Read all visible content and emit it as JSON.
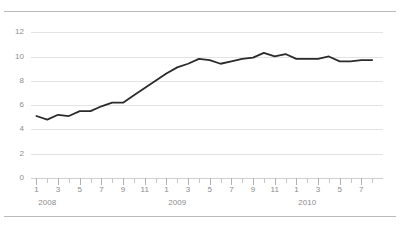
{
  "chart_data": {
    "type": "line",
    "title": "",
    "xlabel": "",
    "ylabel": "",
    "ylim": [
      0,
      13
    ],
    "yticks": [
      0,
      2,
      4,
      6,
      8,
      10,
      12
    ],
    "grid": true,
    "legend": "none",
    "line_color": "#2b2b2b",
    "grid_color": "#e3e3e3",
    "tick_label_color": "#8b8b8b",
    "categories": [
      "2008-01",
      "2008-02",
      "2008-03",
      "2008-04",
      "2008-05",
      "2008-06",
      "2008-07",
      "2008-08",
      "2008-09",
      "2008-10",
      "2008-11",
      "2008-12",
      "2009-01",
      "2009-02",
      "2009-03",
      "2009-04",
      "2009-05",
      "2009-06",
      "2009-07",
      "2009-08",
      "2009-09",
      "2009-10",
      "2009-11",
      "2009-12",
      "2010-01",
      "2010-02",
      "2010-03",
      "2010-04",
      "2010-05",
      "2010-06",
      "2010-07",
      "2010-08"
    ],
    "values": [
      5.1,
      4.8,
      5.2,
      5.1,
      5.5,
      5.5,
      5.9,
      6.2,
      6.2,
      6.8,
      7.4,
      8.0,
      8.6,
      9.1,
      9.4,
      9.8,
      9.7,
      9.4,
      9.6,
      9.8,
      9.9,
      10.3,
      10.0,
      10.2,
      9.8,
      9.8,
      9.8,
      10.0,
      9.6,
      9.6,
      9.7,
      9.7
    ],
    "xtick_labels": [
      "1",
      "3",
      "5",
      "7",
      "9",
      "11",
      "1",
      "3",
      "5",
      "7",
      "9",
      "11",
      "1",
      "3",
      "5",
      "7"
    ],
    "year_labels": [
      "2008",
      "2009",
      "2010"
    ],
    "x_minor_tick_count": 32
  },
  "axis": {
    "y_tick_labels": [
      "12",
      "10",
      "8",
      "6",
      "4",
      "2",
      "0"
    ]
  },
  "header": {
    "faint_title": ""
  }
}
